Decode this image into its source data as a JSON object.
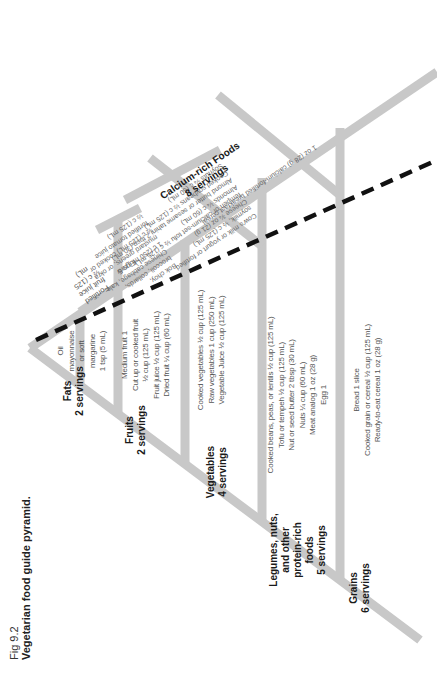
{
  "figure": {
    "number": "Fig 9.2",
    "title": "Vegetarian food guide pyramid."
  },
  "groups": {
    "fats": {
      "name": "Fats",
      "servings": "2 servings",
      "items": [
        "Oil",
        "mayonnaise",
        "or soft",
        "margarine",
        "1 tsp (5 mL)"
      ]
    },
    "fruits": {
      "name": "Fruits",
      "servings": "2 servings",
      "items": [
        "Medium fruit 1",
        "Cut up or cooked fruit",
        "½ cup (125 mL)",
        "Fruit juice ½ cup (125 mL)",
        "Dried fruit ¼ cup (60 mL)"
      ],
      "calcium_items": [
        "Fortified",
        "fruit juice",
        "½ c (125",
        "mL)",
        "Figs 5"
      ]
    },
    "vegetables": {
      "name": "Vegetables",
      "servings": "4 servings",
      "items": [
        "Cooked vegetables ½ cup (125 mL)",
        "Raw vegetables 1 cup (250 mL)",
        "Vegetable Juice ½ cup (125 mL)"
      ],
      "calcium_items": [
        "Bok choy,",
        "broccoli, collards,",
        "Chinese cabbage, kale,",
        "1 c (250 mL) raw",
        "mustard greens, or okra",
        "½ c (125 mL) cooked or",
        "fortified tomato juice",
        "½ c (125 mL)"
      ]
    },
    "legumes": {
      "name": "Legumes, nuts, and other protein-rich foods",
      "name_lines": [
        "Legumes, nuts,",
        "and other",
        "protein-rich",
        "foods"
      ],
      "servings": "5 servings",
      "items": [
        "Cooked beans, peas, or lentils ½ cup (125 mL)",
        "Tofu or tempeh ½ cup (125 mL)",
        "Nut or seed butter 2 tbsp (30 mL)",
        "Nuts ¼ cup (60 mL)",
        "Meat analog 1 oz (28 g)",
        "Egg 1"
      ],
      "calcium_items": [
        "Cow's milk or yogurt or fortified",
        "soymilk, ½ c (125 mL)",
        "Cheese ¾ oz (21 g)",
        "Tempeh or calcium-set tofu ½ c (125 mL)",
        "Almonds ¼ c (60 mL)",
        "Almond butter or sesame tahini 2 tbsp (30 mL)",
        "Cooked soybeans ½ c (125 mL)",
        "Soynuts ¼ c (60 mL)"
      ]
    },
    "grains": {
      "name": "Grains",
      "servings": "6 servings",
      "items": [
        "Bread 1 slice",
        "Cooked grain or cereal ½ cup (125 mL)",
        "Ready-to-eat cereal 1 oz (28 g)"
      ],
      "calcium_items": [
        "1 oz (28 g) calcium-fortified breakfast cereal"
      ]
    },
    "calcium": {
      "name": "Calcium-rich Foods",
      "servings": "8 servings"
    }
  },
  "colors": {
    "frame": "#c8c8c8",
    "dash": "#111111",
    "text": "#555555",
    "heading": "#1a1a1a"
  }
}
